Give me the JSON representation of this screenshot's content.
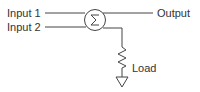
{
  "diagram": {
    "type": "circuit-schematic",
    "labels": {
      "input1": "Input 1",
      "input2": "Input 2",
      "output": "Output",
      "load": "Load"
    },
    "symbols": {
      "summer": "sigma-circle-icon",
      "load": "resistor-icon",
      "ground": "ground-icon"
    },
    "colors": {
      "stroke": "#444444",
      "text": "#333333"
    }
  }
}
